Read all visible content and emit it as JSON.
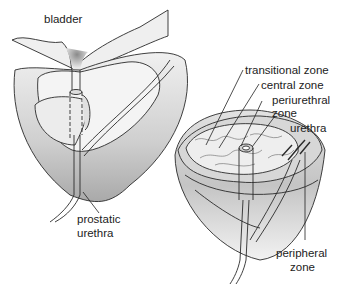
{
  "diagram": {
    "colors": {
      "outline": "#2a2a2a",
      "shade_dark": "#a8a8a8",
      "shade_mid": "#c8c8c8",
      "shade_light": "#e6e6e6",
      "background": "#ffffff"
    },
    "left_view": {
      "labels": {
        "bladder": "bladder",
        "prostatic_urethra_1": "prostatic",
        "prostatic_urethra_2": "urethra"
      }
    },
    "right_view": {
      "labels": {
        "transitional_zone": "transitional zone",
        "central_zone": "central zone",
        "periurethral_zone_1": "periurethral",
        "periurethral_zone_2": "zone",
        "urethra": "urethra",
        "peripheral_zone_1": "peripheral",
        "peripheral_zone_2": "zone"
      }
    }
  }
}
